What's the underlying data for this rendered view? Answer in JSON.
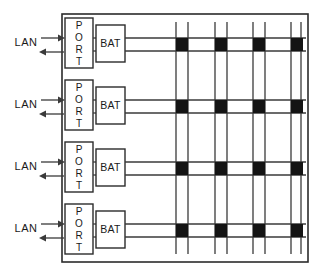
{
  "diagram": {
    "canvas": {
      "width": 320,
      "height": 275
    },
    "colors": {
      "background": "#ffffff",
      "line": "#3a3a3a",
      "chassis": "#2b2b2b",
      "crosspoint": "#141414",
      "text": "#1a1a1a"
    },
    "chassis": {
      "x": 62,
      "y": 14,
      "width": 246,
      "height": 248
    },
    "labels": {
      "lan": "LAN",
      "port": "PORT",
      "port_letters": [
        "P",
        "O",
        "R",
        "T"
      ],
      "bat": "BAT"
    },
    "rows": [
      {
        "index": 1,
        "lan_label": "LAN",
        "port_label": "PORT",
        "bat_label": "BAT",
        "bus_top_y": 38,
        "bus_bottom_y": 51,
        "port_box": {
          "x": 65,
          "y": 18,
          "width": 28,
          "height": 50
        },
        "bat_box": {
          "x": 96,
          "y": 25,
          "width": 29,
          "height": 37
        },
        "arrow_in_y": 38,
        "arrow_out_y": 52,
        "lan_text_x": 26,
        "lan_text_y": 46
      },
      {
        "index": 2,
        "lan_label": "LAN",
        "port_label": "PORT",
        "bat_label": "BAT",
        "bus_top_y": 100,
        "bus_bottom_y": 113,
        "port_box": {
          "x": 65,
          "y": 80,
          "width": 28,
          "height": 50
        },
        "bat_box": {
          "x": 96,
          "y": 87,
          "width": 29,
          "height": 37
        },
        "arrow_in_y": 100,
        "arrow_out_y": 114,
        "lan_text_x": 26,
        "lan_text_y": 108
      },
      {
        "index": 3,
        "lan_label": "LAN",
        "port_label": "PORT",
        "bat_label": "BAT",
        "bus_top_y": 162,
        "bus_bottom_y": 175,
        "port_box": {
          "x": 65,
          "y": 142,
          "width": 28,
          "height": 50
        },
        "bat_box": {
          "x": 96,
          "y": 149,
          "width": 29,
          "height": 37
        },
        "arrow_in_y": 162,
        "arrow_out_y": 176,
        "lan_text_x": 26,
        "lan_text_y": 170
      },
      {
        "index": 4,
        "lan_label": "LAN",
        "port_label": "PORT",
        "bat_label": "BAT",
        "bus_top_y": 224,
        "bus_bottom_y": 237,
        "port_box": {
          "x": 65,
          "y": 204,
          "width": 28,
          "height": 50
        },
        "bat_box": {
          "x": 96,
          "y": 211,
          "width": 29,
          "height": 37
        },
        "arrow_in_y": 224,
        "arrow_out_y": 238,
        "lan_text_x": 26,
        "lan_text_y": 232
      }
    ],
    "crossbar": {
      "column_count": 4,
      "columns": [
        {
          "index": 1,
          "left_x": 176,
          "right_x": 188
        },
        {
          "index": 2,
          "left_x": 215,
          "right_x": 227
        },
        {
          "index": 3,
          "left_x": 253,
          "right_x": 265
        },
        {
          "index": 4,
          "left_x": 291,
          "right_x": 301
        }
      ],
      "column_top_y": 22,
      "column_bottom_y": 254,
      "crosspoint_size": {
        "width": 12,
        "height": 13
      },
      "crosspoint_rows": [
        38,
        100,
        162,
        224
      ],
      "bus_end_x": 306
    }
  }
}
